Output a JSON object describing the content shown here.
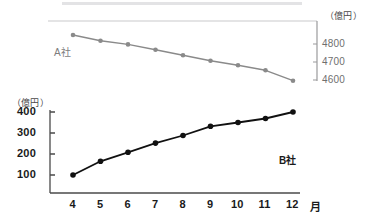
{
  "figure": {
    "top_strip": "decorative-grey-bar"
  },
  "chart_data": [
    {
      "type": "line",
      "name": "A社",
      "series_label": "A社",
      "title": "",
      "xlabel": "月",
      "ylabel": "（億円）",
      "unit_label": "（億円）",
      "axis_side": "right",
      "color": "#8a8a8a",
      "grid": false,
      "legend_position": "inline-left",
      "x": [
        4,
        5,
        6,
        7,
        8,
        9,
        10,
        11,
        12
      ],
      "xtick_labels": [
        "4",
        "5",
        "6",
        "7",
        "8",
        "9",
        "10",
        "11",
        "12"
      ],
      "yticks": [
        4600,
        4700,
        4800
      ],
      "ytick_labels": [
        "4600",
        "4700",
        "4800"
      ],
      "ylim": [
        4540,
        4900
      ],
      "values": [
        4850,
        4818,
        4798,
        4768,
        4738,
        4707,
        4682,
        4654,
        4596
      ]
    },
    {
      "type": "line",
      "name": "B社",
      "series_label": "B社",
      "title": "",
      "xlabel": "月",
      "ylabel": "（億円）",
      "unit_label": "（億円）",
      "axis_side": "left",
      "color": "#111111",
      "grid": false,
      "legend_position": "inline-right",
      "x": [
        4,
        5,
        6,
        7,
        8,
        9,
        10,
        11,
        12
      ],
      "xtick_labels": [
        "4",
        "5",
        "6",
        "7",
        "8",
        "9",
        "10",
        "11",
        "12"
      ],
      "yticks": [
        100,
        200,
        300,
        400
      ],
      "ytick_labels": [
        "100",
        "200",
        "300",
        "400"
      ],
      "ylim": [
        20,
        420
      ],
      "values": [
        100,
        165,
        208,
        252,
        288,
        332,
        350,
        369,
        400
      ]
    }
  ],
  "axes": {
    "top": {
      "unit": "（億円）",
      "series_label": "A社",
      "ytick_labels": [
        "4800",
        "4700",
        "4600"
      ]
    },
    "bottom": {
      "unit": "（億円）",
      "series_label": "B社",
      "ytick_labels": [
        "400",
        "300",
        "200",
        "100"
      ],
      "xtick_labels": [
        "4",
        "5",
        "6",
        "7",
        "8",
        "9",
        "10",
        "11",
        "12"
      ],
      "x_unit": "月"
    }
  }
}
